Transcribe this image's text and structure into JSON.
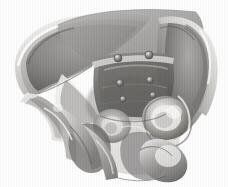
{
  "view": {
    "title": "3D Pelvis Surface Rendering",
    "subject": "bony pelvis",
    "orientation": "anterior-superior oblique",
    "render_mode": "semi-transparent grayscale surface",
    "background_color": "#ffffff",
    "canvas": {
      "width": 228,
      "height": 187
    }
  },
  "palette": {
    "background": "#ffffff",
    "bone_light": "#f2f1ef",
    "bone_mid": "#b9b7b4",
    "bone_dark": "#6e6c6a",
    "bone_deepest": "#3f3e3d",
    "plane_gray": "#8e8d8b",
    "plane_light_gray": "#d9d8d6",
    "outline": "#5a5958",
    "landmark": "#6a6967"
  },
  "structures": [
    {
      "id": "ilium-left",
      "label": "Left iliac wing",
      "interactable": false
    },
    {
      "id": "ilium-right",
      "label": "Right iliac wing",
      "interactable": false
    },
    {
      "id": "iliac-crest-left",
      "label": "Left iliac crest",
      "interactable": false
    },
    {
      "id": "iliac-crest-right",
      "label": "Right iliac crest",
      "interactable": false
    },
    {
      "id": "sacrum",
      "label": "Sacrum",
      "interactable": false
    },
    {
      "id": "sacral-promontory",
      "label": "Sacral promontory",
      "interactable": false
    },
    {
      "id": "acetabulum-left",
      "label": "Left acetabulum",
      "interactable": false
    },
    {
      "id": "acetabulum-right",
      "label": "Right acetabulum",
      "interactable": false
    },
    {
      "id": "obturator-foramen-left",
      "label": "Left obturator foramen",
      "interactable": false
    },
    {
      "id": "obturator-foramen-right",
      "label": "Right obturator foramen",
      "interactable": false
    },
    {
      "id": "pubic-symphysis",
      "label": "Pubic symphysis",
      "interactable": false
    },
    {
      "id": "ischial-spine",
      "label": "Ischial spine",
      "interactable": false
    },
    {
      "id": "inlet-plane",
      "label": "Pelvic inlet plane",
      "interactable": false
    },
    {
      "id": "outlet-plane",
      "label": "Pelvic outlet plane",
      "interactable": false
    }
  ],
  "landmarks": [
    {
      "id": "lm-1",
      "label": "Landmark 1",
      "cx": 118,
      "cy": 58,
      "r": 4.0
    },
    {
      "id": "lm-2",
      "label": "Landmark 2",
      "cx": 149,
      "cy": 55,
      "r": 4.0
    },
    {
      "id": "lm-3",
      "label": "Landmark 3",
      "cx": 120,
      "cy": 83,
      "r": 3.4
    },
    {
      "id": "lm-4",
      "label": "Landmark 4",
      "cx": 150,
      "cy": 80,
      "r": 3.4
    },
    {
      "id": "lm-5",
      "label": "Landmark 5",
      "cx": 123,
      "cy": 99,
      "r": 3.0
    },
    {
      "id": "lm-6",
      "label": "Landmark 6",
      "cx": 153,
      "cy": 95,
      "r": 3.0
    }
  ],
  "overlay": {
    "caption": "",
    "scale_bar": "",
    "annotation": ""
  }
}
